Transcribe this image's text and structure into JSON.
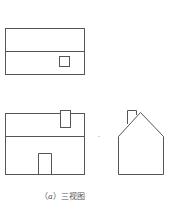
{
  "figure": {
    "caption_prefix": "（",
    "caption_label": "a",
    "caption_suffix": "）三视图",
    "stroke_color": "#555555",
    "views": [
      {
        "name": "top-view",
        "description": "Rectangle with horizontal ridge line and small square (chimney)"
      },
      {
        "name": "front-view",
        "description": "Rectangle with roof line, chimney and door"
      },
      {
        "name": "side-view",
        "description": "Pentagon house shape with chimney"
      }
    ]
  }
}
